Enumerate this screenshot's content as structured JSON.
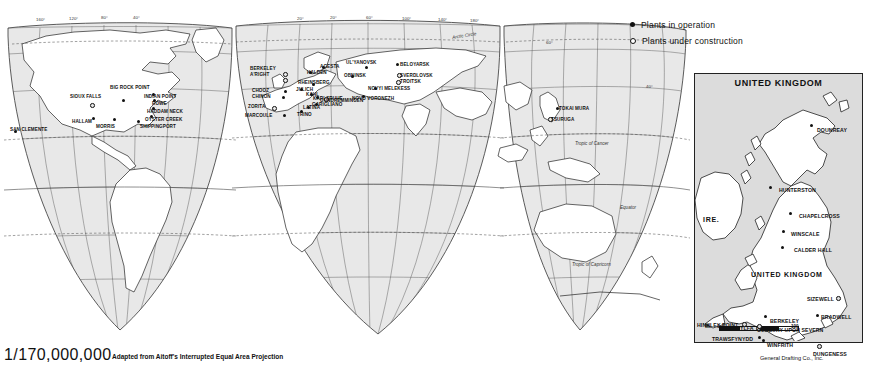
{
  "map": {
    "title": "World Map of Nuclear Power Plants",
    "scale_text": "1/170,000,000",
    "projection_note": "Adapted from Aitoff's Interrupted Equal Area Projection",
    "credit": "General Drafting Co., Inc.",
    "background_color": "#e8e8e8",
    "ink_color": "#111111"
  },
  "legend": {
    "items": [
      {
        "symbol": "filled-dot",
        "label": "Plants in operation"
      },
      {
        "symbol": "open-dot",
        "label": "Plants under construction"
      }
    ]
  },
  "graticule": {
    "longitude_west": [
      "160°",
      "120°",
      "80°",
      "40°"
    ],
    "longitude_east": [
      "20°",
      "20°",
      "60°",
      "100°",
      "140°",
      "180°"
    ],
    "latitude_right": [
      "60°",
      "40°"
    ],
    "named_lines": [
      "Arctic Circle",
      "Tropic of Cancer",
      "Equator",
      "Tropic of Capricorn"
    ]
  },
  "world_plants": [
    {
      "name": "SAN CLEMENTE",
      "x": 14,
      "y": 130,
      "label_x": 10,
      "label_y": 127,
      "status": "operation"
    },
    {
      "name": "SIOUX FALLS",
      "x": 90,
      "y": 103,
      "label_x": 70,
      "label_y": 94,
      "status": "construction"
    },
    {
      "name": "HALLAM",
      "x": 92,
      "y": 117,
      "label_x": 72,
      "label_y": 119,
      "status": "operation"
    },
    {
      "name": "BIG ROCK POINT",
      "x": 122,
      "y": 99,
      "label_x": 110,
      "label_y": 85,
      "status": "operation"
    },
    {
      "name": "MORRIS",
      "x": 113,
      "y": 118,
      "label_x": 96,
      "label_y": 124,
      "status": "operation"
    },
    {
      "name": "SHIPPINGPORT",
      "x": 137,
      "y": 120,
      "label_x": 140,
      "label_y": 124,
      "status": "operation"
    },
    {
      "name": "OYSTER CREEK",
      "x": 150,
      "y": 115,
      "label_x": 145,
      "label_y": 117,
      "status": "operation"
    },
    {
      "name": "HADDAM NECK",
      "x": 152,
      "y": 107,
      "label_x": 147,
      "label_y": 109,
      "status": "operation"
    },
    {
      "name": "ROWE",
      "x": 153,
      "y": 99,
      "label_x": 152,
      "label_y": 101,
      "status": "operation"
    },
    {
      "name": "INDIAN POINT",
      "x": 152,
      "y": 93,
      "label_x": 144,
      "label_y": 94,
      "status": "operation"
    },
    {
      "name": "BERKELEY",
      "x": 283,
      "y": 72,
      "label_x": 250,
      "label_y": 66,
      "status": "construction"
    },
    {
      "name": "A'RIGHT",
      "x": 283,
      "y": 78,
      "label_x": 250,
      "label_y": 72,
      "status": "construction"
    },
    {
      "name": "CHOOZ",
      "x": 284,
      "y": 90,
      "label_x": 252,
      "label_y": 88,
      "status": "operation"
    },
    {
      "name": "CHINON",
      "x": 282,
      "y": 96,
      "label_x": 252,
      "label_y": 94,
      "status": "operation"
    },
    {
      "name": "ZORITA",
      "x": 272,
      "y": 106,
      "label_x": 248,
      "label_y": 104,
      "status": "construction"
    },
    {
      "name": "MARCOULE",
      "x": 283,
      "y": 114,
      "label_x": 245,
      "label_y": 113,
      "status": "operation"
    },
    {
      "name": "TRINO",
      "x": 300,
      "y": 110,
      "label_x": 297,
      "label_y": 112,
      "status": "operation"
    },
    {
      "name": "LATINA",
      "x": 307,
      "y": 106,
      "label_x": 303,
      "label_y": 105,
      "status": "operation"
    },
    {
      "name": "GARIGLIANO",
      "x": 315,
      "y": 103,
      "label_x": 312,
      "label_y": 102,
      "status": "operation"
    },
    {
      "name": "KAHL",
      "x": 310,
      "y": 93,
      "label_x": 306,
      "label_y": 92,
      "status": "operation"
    },
    {
      "name": "JULICH",
      "x": 300,
      "y": 88,
      "label_x": 296,
      "label_y": 87,
      "status": "operation"
    },
    {
      "name": "KARLSRUHE",
      "x": 316,
      "y": 96,
      "label_x": 313,
      "label_y": 96,
      "status": "operation"
    },
    {
      "name": "GUNDREMMINGEN",
      "x": 324,
      "y": 97,
      "label_x": 320,
      "label_y": 98,
      "status": "construction"
    },
    {
      "name": "RHEINSBERG",
      "x": 312,
      "y": 83,
      "label_x": 298,
      "label_y": 80,
      "status": "operation"
    },
    {
      "name": "HALDEN",
      "x": 309,
      "y": 71,
      "label_x": 307,
      "label_y": 70,
      "status": "operation"
    },
    {
      "name": "AGESTA",
      "x": 322,
      "y": 66,
      "label_x": 320,
      "label_y": 64,
      "status": "operation"
    },
    {
      "name": "UL'YANOVSK",
      "x": 365,
      "y": 66,
      "label_x": 346,
      "label_y": 60,
      "status": "operation"
    },
    {
      "name": "OBNINSK",
      "x": 351,
      "y": 75,
      "label_x": 344,
      "label_y": 73,
      "status": "operation"
    },
    {
      "name": "BELOYARSK",
      "x": 396,
      "y": 63,
      "label_x": 400,
      "label_y": 62,
      "status": "operation"
    },
    {
      "name": "SVERDLOVSK",
      "x": 397,
      "y": 73,
      "label_x": 400,
      "label_y": 73,
      "status": "construction"
    },
    {
      "name": "TROITSK",
      "x": 396,
      "y": 80,
      "label_x": 400,
      "label_y": 79,
      "status": "construction"
    },
    {
      "name": "NOVYI MELEKESS",
      "x": 374,
      "y": 87,
      "label_x": 368,
      "label_y": 86,
      "status": "operation"
    },
    {
      "name": "NOVO VORONEZH",
      "x": 362,
      "y": 95,
      "label_x": 352,
      "label_y": 96,
      "status": "operation"
    },
    {
      "name": "TOKAI MURA",
      "x": 556,
      "y": 107,
      "label_x": 559,
      "label_y": 106,
      "status": "operation"
    },
    {
      "name": "TSURUGA",
      "x": 548,
      "y": 117,
      "label_x": 551,
      "label_y": 117,
      "status": "construction"
    }
  ],
  "inset": {
    "title": "UNITED KINGDOM",
    "region_labels": [
      {
        "text": "IRE.",
        "x": 8,
        "y": 142
      },
      {
        "text": "UNITED KINGDOM",
        "x": 56,
        "y": 197
      }
    ],
    "scale_bar": {
      "unit_label": "MI.",
      "zero": "0",
      "max": "100"
    },
    "plants": [
      {
        "name": "DOUNREAY",
        "label_x": 122,
        "label_y": 53,
        "dot_x": 115,
        "dot_y": 50,
        "status": "operation"
      },
      {
        "name": "HUNTERSTON",
        "label_x": 84,
        "label_y": 113,
        "dot_x": 74,
        "dot_y": 112,
        "status": "operation"
      },
      {
        "name": "CHAPELCROSS",
        "label_x": 104,
        "label_y": 139,
        "dot_x": 94,
        "dot_y": 138,
        "status": "operation"
      },
      {
        "name": "WINSCALE",
        "label_x": 96,
        "label_y": 157,
        "dot_x": 87,
        "dot_y": 156,
        "status": "operation"
      },
      {
        "name": "CALDER HALL",
        "label_x": 99,
        "label_y": 173,
        "dot_x": 86,
        "dot_y": 172,
        "status": "operation"
      },
      {
        "name": "WYLFA",
        "label_x": 40,
        "label_y": 251,
        "dot_x": 61,
        "dot_y": 252,
        "status": "construction"
      },
      {
        "name": "TRAWSFYNYDD",
        "label_x": 17,
        "label_y": 262,
        "dot_x": 63,
        "dot_y": 262,
        "status": "operation"
      },
      {
        "name": "SIZEWELL",
        "label_x": 112,
        "label_y": 222,
        "dot_x": 141,
        "dot_y": 222,
        "status": "construction"
      },
      {
        "name": "BRADWELL",
        "label_x": 126,
        "label_y": 240,
        "dot_x": 121,
        "dot_y": 240,
        "status": "operation"
      },
      {
        "name": "BERKELEY",
        "label_x": 75,
        "label_y": 244,
        "dot_x": 69,
        "dot_y": 241,
        "status": "operation"
      },
      {
        "name": "OLDBURY UPON SEVERN",
        "label_x": 62,
        "label_y": 253,
        "dot_x": 62,
        "dot_y": 250,
        "status": "construction"
      },
      {
        "name": "HINKLEY POINT",
        "label_x": 2,
        "label_y": 248,
        "dot_x": 47,
        "dot_y": 248,
        "status": "construction"
      },
      {
        "name": "WINFRITH",
        "label_x": 72,
        "label_y": 268,
        "dot_x": 67,
        "dot_y": 265,
        "status": "operation"
      },
      {
        "name": "DUNGENESS",
        "label_x": 118,
        "label_y": 277,
        "dot_x": 122,
        "dot_y": 270,
        "status": "construction"
      }
    ]
  }
}
